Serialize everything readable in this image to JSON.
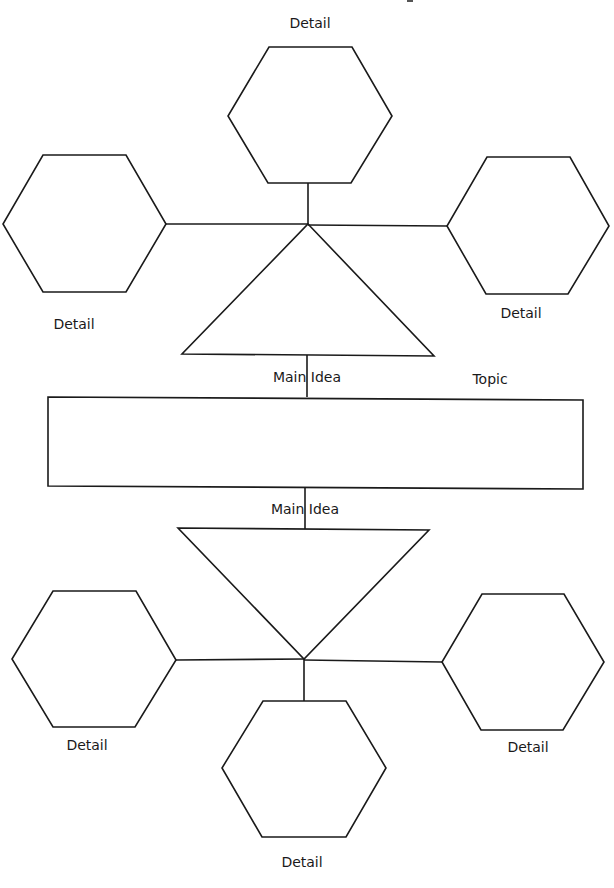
{
  "diagram": {
    "type": "main-idea-detail organizer",
    "colors": {
      "line": "#1a1a1a",
      "background": "#ffffff"
    },
    "topic": {
      "label": "Topic"
    },
    "upper": {
      "main_idea_label": "Main Idea",
      "details": [
        {
          "position": "top",
          "label": "Detail"
        },
        {
          "position": "left",
          "label": "Detail"
        },
        {
          "position": "right",
          "label": "Detail"
        }
      ]
    },
    "lower": {
      "main_idea_label": "Main Idea",
      "details": [
        {
          "position": "left",
          "label": "Detail"
        },
        {
          "position": "right",
          "label": "Detail"
        },
        {
          "position": "bottom",
          "label": "Detail"
        }
      ]
    }
  }
}
